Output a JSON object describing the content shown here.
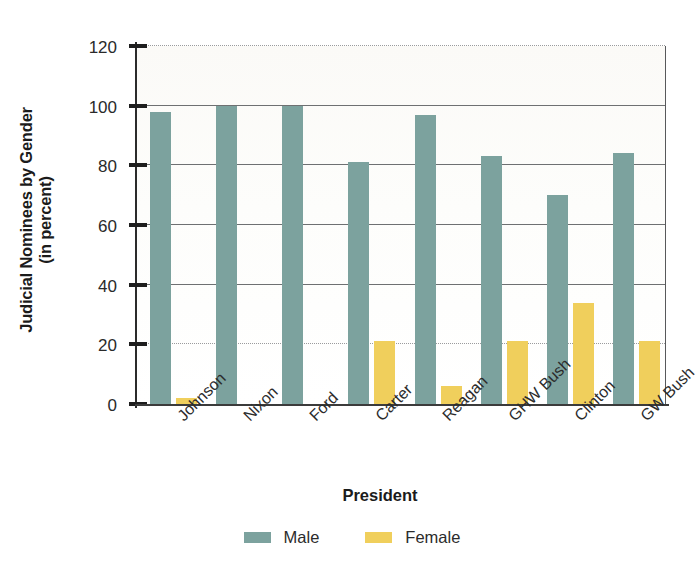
{
  "chart_data": {
    "type": "bar",
    "title": "",
    "xlabel": "President",
    "ylabel_line1": "Judicial Nominees by Gender",
    "ylabel_line2": "(in percent)",
    "categories": [
      "Johnson",
      "Nixon",
      "Ford",
      "Carter",
      "Reagan",
      "GHW Bush",
      "Clinton",
      "GW Bush"
    ],
    "series": [
      {
        "name": "Male",
        "color": "#7ca29e",
        "values": [
          98,
          100,
          100,
          81,
          97,
          83,
          70,
          84
        ]
      },
      {
        "name": "Female",
        "color": "#f0cf5c",
        "values": [
          2,
          0,
          0,
          21,
          6,
          21,
          34,
          21
        ]
      }
    ],
    "ylim": [
      0,
      120
    ],
    "yticks": [
      0,
      20,
      40,
      60,
      80,
      100,
      120
    ],
    "ytick_labels": [
      "0",
      "20",
      "40",
      "60",
      "80",
      "100",
      "120"
    ],
    "grid": true,
    "grid_axis": "y",
    "legend_position": "bottom",
    "legend_entries": [
      "Male",
      "Female"
    ],
    "xtick_rotation": -45
  }
}
